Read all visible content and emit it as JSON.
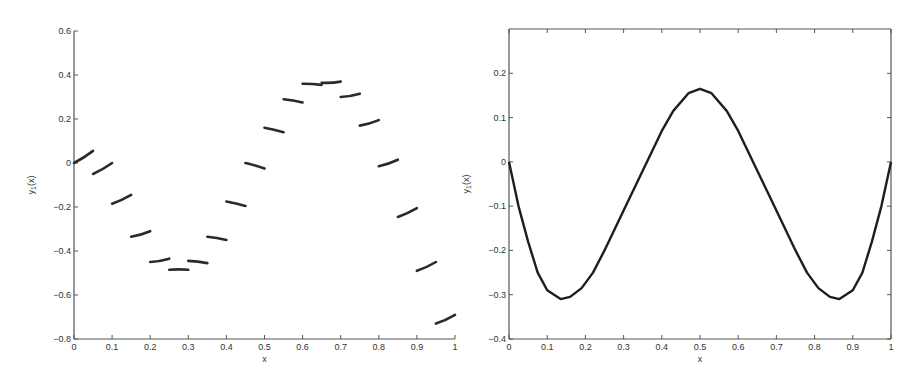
{
  "chart_data": [
    {
      "type": "line",
      "title": "",
      "xlabel": "x",
      "ylabel": "y_1(x)",
      "ylabel_main": "y",
      "ylabel_sub": "1",
      "ylabel_tail": "(x)",
      "xlim": [
        0,
        1
      ],
      "ylim": [
        -0.8,
        0.6
      ],
      "grid": false,
      "box": false,
      "xticks": [
        "0",
        "0.1",
        "0.2",
        "0.3",
        "0.4",
        "0.5",
        "0.6",
        "0.7",
        "0.8",
        "0.9",
        "1"
      ],
      "yticks": [
        "-0.8",
        "-0.6",
        "-0.4",
        "-0.2",
        "0",
        "0.2",
        "0.4",
        "0.6"
      ],
      "description": "Piecewise discontinuous segments on intervals of width 0.05",
      "segments": [
        {
          "x": [
            0.0,
            0.05
          ],
          "y": [
            0.0,
            0.055
          ]
        },
        {
          "x": [
            0.05,
            0.1
          ],
          "y": [
            -0.05,
            0.0
          ]
        },
        {
          "x": [
            0.1,
            0.15
          ],
          "y": [
            -0.185,
            -0.145
          ]
        },
        {
          "x": [
            0.15,
            0.2
          ],
          "y": [
            -0.335,
            -0.31
          ]
        },
        {
          "x": [
            0.2,
            0.25
          ],
          "y": [
            -0.45,
            -0.435
          ]
        },
        {
          "x": [
            0.25,
            0.3
          ],
          "y": [
            -0.485,
            -0.485
          ]
        },
        {
          "x": [
            0.3,
            0.35
          ],
          "y": [
            -0.445,
            -0.455
          ]
        },
        {
          "x": [
            0.35,
            0.4
          ],
          "y": [
            -0.335,
            -0.35
          ]
        },
        {
          "x": [
            0.4,
            0.45
          ],
          "y": [
            -0.175,
            -0.195
          ]
        },
        {
          "x": [
            0.45,
            0.5
          ],
          "y": [
            0.0,
            -0.025
          ]
        },
        {
          "x": [
            0.5,
            0.55
          ],
          "y": [
            0.16,
            0.14
          ]
        },
        {
          "x": [
            0.55,
            0.6
          ],
          "y": [
            0.29,
            0.275
          ]
        },
        {
          "x": [
            0.6,
            0.65
          ],
          "y": [
            0.36,
            0.355
          ]
        },
        {
          "x": [
            0.65,
            0.7
          ],
          "y": [
            0.365,
            0.37
          ]
        },
        {
          "x": [
            0.7,
            0.75
          ],
          "y": [
            0.3,
            0.315
          ]
        },
        {
          "x": [
            0.75,
            0.8
          ],
          "y": [
            0.17,
            0.195
          ]
        },
        {
          "x": [
            0.8,
            0.85
          ],
          "y": [
            -0.015,
            0.015
          ]
        },
        {
          "x": [
            0.85,
            0.9
          ],
          "y": [
            -0.245,
            -0.205
          ]
        },
        {
          "x": [
            0.9,
            0.95
          ],
          "y": [
            -0.49,
            -0.45
          ]
        },
        {
          "x": [
            0.95,
            1.0
          ],
          "y": [
            -0.73,
            -0.69
          ]
        }
      ]
    },
    {
      "type": "line",
      "title": "",
      "xlabel": "x",
      "ylabel": "y_1(x)",
      "ylabel_main": "y",
      "ylabel_sub": "1",
      "ylabel_tail": "(x)",
      "xlim": [
        0,
        1
      ],
      "ylim": [
        -0.4,
        0.3
      ],
      "grid": false,
      "box": true,
      "xticks": [
        "0",
        "0.1",
        "0.2",
        "0.3",
        "0.4",
        "0.5",
        "0.6",
        "0.7",
        "0.8",
        "0.9",
        "1"
      ],
      "yticks": [
        "-0.4",
        "-0.3",
        "-0.2",
        "-0.1",
        "0",
        "0.1",
        "0.2"
      ],
      "series": [
        {
          "name": "y_1(x)",
          "x": [
            0,
            0.025,
            0.05,
            0.075,
            0.1,
            0.135,
            0.16,
            0.19,
            0.22,
            0.25,
            0.3,
            0.35,
            0.4,
            0.43,
            0.47,
            0.5,
            0.53,
            0.57,
            0.6,
            0.65,
            0.7,
            0.75,
            0.78,
            0.81,
            0.84,
            0.865,
            0.9,
            0.925,
            0.95,
            0.975,
            1
          ],
          "y": [
            0,
            -0.1,
            -0.18,
            -0.25,
            -0.29,
            -0.31,
            -0.305,
            -0.285,
            -0.25,
            -0.2,
            -0.11,
            -0.02,
            0.07,
            0.115,
            0.155,
            0.165,
            0.155,
            0.115,
            0.07,
            -0.02,
            -0.11,
            -0.2,
            -0.25,
            -0.285,
            -0.305,
            -0.31,
            -0.29,
            -0.25,
            -0.18,
            -0.1,
            0
          ]
        }
      ]
    }
  ]
}
